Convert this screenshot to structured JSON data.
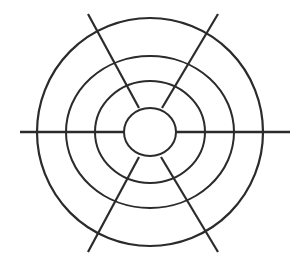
{
  "figure": {
    "name": "concentric-circles-with-radial-lines",
    "background_color": "#ffffff",
    "stroke_color": "#2b2b2b",
    "canvas": {
      "width": 301,
      "height": 265
    },
    "center": {
      "x": 150,
      "y": 132
    }
  },
  "chart_data": {
    "type": "diagram",
    "subtitle": "",
    "xlabel": "",
    "ylabel": "",
    "grid": false,
    "legend": false,
    "center": {
      "x": 150,
      "y": 132
    },
    "background_color": "#ffffff",
    "stroke_color": "#2b2b2b",
    "rings": [
      {
        "label": "ring-1-innermost",
        "rx": 26,
        "ry": 24,
        "stroke_width": 2.0
      },
      {
        "label": "ring-2",
        "rx": 55,
        "ry": 51,
        "stroke_width": 2.0
      },
      {
        "label": "ring-3",
        "rx": 84,
        "ry": 76,
        "stroke_width": 2.0
      },
      {
        "label": "ring-4-outermost",
        "rx": 113,
        "ry": 114,
        "stroke_width": 2.2
      }
    ],
    "lines": [
      {
        "label": "horizontal-axis-left",
        "x1": 20,
        "y1": 132,
        "x2": 124,
        "y2": 132,
        "stroke_width": 2.4
      },
      {
        "label": "horizontal-axis-right",
        "x1": 176,
        "y1": 132,
        "x2": 290,
        "y2": 132,
        "stroke_width": 2.4
      },
      {
        "label": "diagonal-nw-se-upper",
        "x1": 88,
        "y1": 14,
        "x2": 139,
        "y2": 108,
        "stroke_width": 2.2
      },
      {
        "label": "diagonal-nw-se-lower",
        "x1": 161,
        "y1": 157,
        "x2": 218,
        "y2": 252,
        "stroke_width": 2.2
      },
      {
        "label": "diagonal-ne-sw-upper",
        "x1": 218,
        "y1": 14,
        "x2": 162,
        "y2": 108,
        "stroke_width": 2.2
      },
      {
        "label": "diagonal-ne-sw-lower",
        "x1": 139,
        "y1": 157,
        "x2": 88,
        "y2": 252,
        "stroke_width": 2.2
      }
    ]
  }
}
